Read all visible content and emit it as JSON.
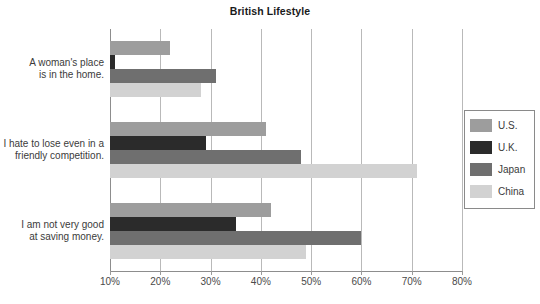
{
  "chart_data": {
    "type": "bar",
    "orientation": "horizontal",
    "title": "British Lifestyle",
    "xlabel": "",
    "ylabel": "",
    "xlim": [
      10,
      80
    ],
    "xticks": [
      "10%",
      "20%",
      "30%",
      "40%",
      "50%",
      "60%",
      "70%",
      "80%"
    ],
    "xtick_values": [
      10,
      20,
      30,
      40,
      50,
      60,
      70,
      80
    ],
    "grid": true,
    "legend_position": "right",
    "categories": [
      "A woman's place is in the home.",
      "I hate to lose even in a friendly competition.",
      "I am not very good at saving money."
    ],
    "category_lines": [
      [
        "A woman's place",
        "is in the home."
      ],
      [
        "I hate to lose even in a",
        "friendly competition."
      ],
      [
        "I am not very good",
        "at saving money."
      ]
    ],
    "series": [
      {
        "name": "U.S.",
        "color": "#9d9d9d",
        "values": [
          22,
          41,
          42
        ]
      },
      {
        "name": "U.K.",
        "color": "#2b2b2b",
        "values": [
          11,
          29,
          35
        ]
      },
      {
        "name": "Japan",
        "color": "#6f6f6f",
        "values": [
          31,
          48,
          60
        ]
      },
      {
        "name": "China",
        "color": "#d2d2d2",
        "values": [
          28,
          71,
          49
        ]
      }
    ]
  },
  "legend": {
    "items": [
      {
        "label": "U.S."
      },
      {
        "label": "U.K."
      },
      {
        "label": "Japan"
      },
      {
        "label": "China"
      }
    ]
  },
  "axis": {
    "gridline_color": "#b9b9b9",
    "baseline_color": "#8d8d8d"
  }
}
